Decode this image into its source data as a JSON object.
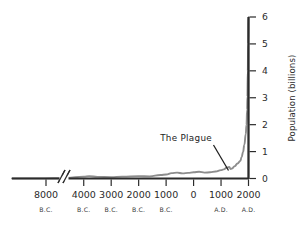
{
  "chart_data": {
    "type": "line",
    "title": "",
    "subtitle": "",
    "xlabel": "",
    "ylabel": "Population (billions)",
    "ylim": [
      0,
      6
    ],
    "yticks": [
      0,
      1,
      2,
      3,
      4,
      5,
      6
    ],
    "ytick_labels": [
      "0",
      "1",
      "2",
      "3",
      "4",
      "5",
      "6"
    ],
    "y_axis_position": "right",
    "grid": false,
    "legend": null,
    "axis_break": {
      "present": true,
      "style": "double-slash",
      "between": [
        "8000 B.C.",
        "4000 B.C."
      ]
    },
    "xtick_labels": [
      "8000",
      "4000",
      "3000",
      "2000",
      "1000",
      "0",
      "1000",
      "2000"
    ],
    "xtick_eras": [
      "B.C.",
      "B.C.",
      "B.C.",
      "B.C.",
      "B.C.",
      "",
      "A.D.",
      "A.D."
    ],
    "xticks_year": [
      -8000,
      -4000,
      -3000,
      -2000,
      -1000,
      0,
      1000,
      2000
    ],
    "annotations": [
      {
        "text": "The Plague",
        "points_to_year": 1350,
        "points_to_value": 0.35
      }
    ],
    "series": [
      {
        "name": "World population",
        "units": "billions",
        "points": [
          {
            "year": -10000,
            "value": 0.004
          },
          {
            "year": -8000,
            "value": 0.005
          },
          {
            "year": -6000,
            "value": 0.01
          },
          {
            "year": -5000,
            "value": 0.02
          },
          {
            "year": -4000,
            "value": 0.07
          },
          {
            "year": -3800,
            "value": 0.09
          },
          {
            "year": -3500,
            "value": 0.06
          },
          {
            "year": -3000,
            "value": 0.05
          },
          {
            "year": -2600,
            "value": 0.07
          },
          {
            "year": -2000,
            "value": 0.09
          },
          {
            "year": -1600,
            "value": 0.08
          },
          {
            "year": -1200,
            "value": 0.13
          },
          {
            "year": -1000,
            "value": 0.15
          },
          {
            "year": -800,
            "value": 0.2
          },
          {
            "year": -600,
            "value": 0.22
          },
          {
            "year": -400,
            "value": 0.19
          },
          {
            "year": -200,
            "value": 0.21
          },
          {
            "year": 0,
            "value": 0.23
          },
          {
            "year": 200,
            "value": 0.25
          },
          {
            "year": 400,
            "value": 0.22
          },
          {
            "year": 600,
            "value": 0.23
          },
          {
            "year": 800,
            "value": 0.26
          },
          {
            "year": 1000,
            "value": 0.31
          },
          {
            "year": 1100,
            "value": 0.34
          },
          {
            "year": 1200,
            "value": 0.4
          },
          {
            "year": 1300,
            "value": 0.43
          },
          {
            "year": 1350,
            "value": 0.35
          },
          {
            "year": 1400,
            "value": 0.37
          },
          {
            "year": 1500,
            "value": 0.46
          },
          {
            "year": 1600,
            "value": 0.56
          },
          {
            "year": 1700,
            "value": 0.65
          },
          {
            "year": 1750,
            "value": 0.79
          },
          {
            "year": 1800,
            "value": 0.98
          },
          {
            "year": 1850,
            "value": 1.26
          },
          {
            "year": 1900,
            "value": 1.65
          },
          {
            "year": 1927,
            "value": 2.0
          },
          {
            "year": 1950,
            "value": 2.56
          },
          {
            "year": 1960,
            "value": 3.04
          },
          {
            "year": 1974,
            "value": 4.0
          },
          {
            "year": 1987,
            "value": 5.0
          },
          {
            "year": 1999,
            "value": 6.0
          }
        ]
      }
    ],
    "colors": {
      "curve": "#8d8d8d",
      "axis": "#2b2b2b",
      "annotation_leader": "#1d1d1d",
      "background": "#ffffff"
    }
  }
}
